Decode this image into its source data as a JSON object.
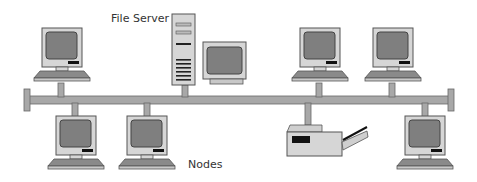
{
  "diagram": {
    "labels": {
      "file_server": "File Server",
      "nodes": "Nodes"
    },
    "components": [
      {
        "id": "pc-top-1",
        "type": "computer",
        "position": "top"
      },
      {
        "id": "file-server",
        "type": "server",
        "position": "top"
      },
      {
        "id": "pc-top-2",
        "type": "computer",
        "position": "top"
      },
      {
        "id": "pc-top-3",
        "type": "computer",
        "position": "top"
      },
      {
        "id": "pc-bottom-1",
        "type": "computer",
        "position": "bottom"
      },
      {
        "id": "pc-bottom-2",
        "type": "computer",
        "position": "bottom"
      },
      {
        "id": "printer",
        "type": "printer",
        "position": "bottom"
      },
      {
        "id": "pc-bottom-3",
        "type": "computer",
        "position": "bottom"
      }
    ],
    "colors": {
      "casing": "#d6d6d6",
      "screen": "#7f7f7f",
      "outline": "#555555",
      "bus": "#a8a8a8",
      "slot": "#111111"
    }
  }
}
